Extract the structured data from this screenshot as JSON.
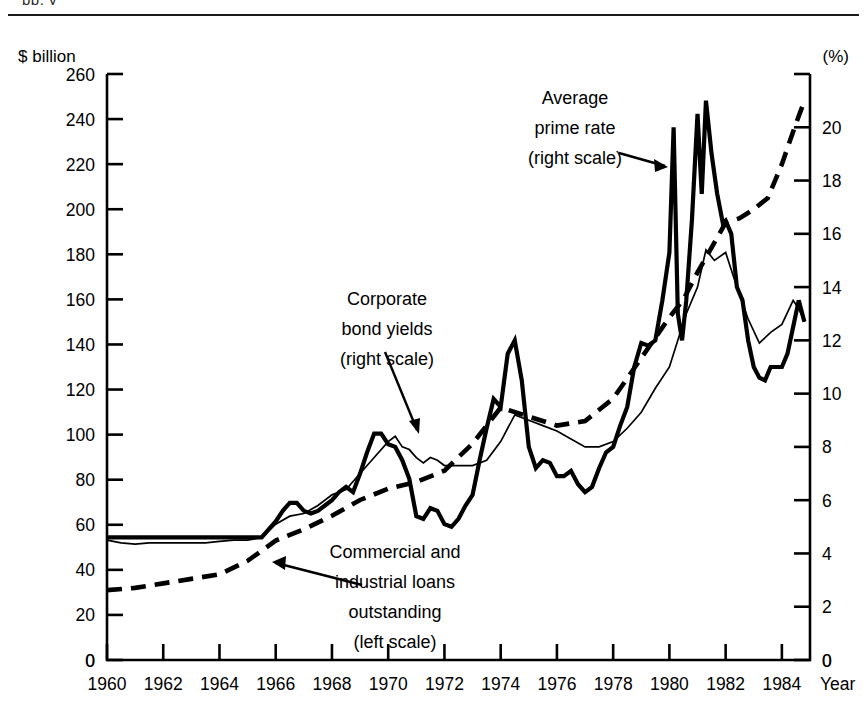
{
  "page": {
    "top_cut_text": "pp. y",
    "background": "#ffffff",
    "ink": "#000000"
  },
  "chart_data": {
    "type": "line",
    "title": "",
    "xlabel": "Year",
    "grid": false,
    "legend_position": "inline-annotations",
    "left_axis": {
      "label": "$ billion",
      "ticks": [
        0,
        20,
        40,
        60,
        80,
        100,
        120,
        140,
        160,
        180,
        200,
        220,
        240,
        260
      ],
      "lim": [
        0,
        260
      ]
    },
    "right_axis": {
      "label": "(%)",
      "ticks": [
        0,
        2,
        4,
        6,
        8,
        10,
        12,
        14,
        16,
        18,
        20
      ],
      "lim": [
        0,
        22
      ]
    },
    "x_axis": {
      "tick_labels": [
        "1960",
        "1962",
        "1964",
        "1966",
        "1968",
        "1970",
        "1972",
        "1974",
        "1976",
        "1978",
        "1980",
        "1982",
        "1984"
      ],
      "tick_values": [
        1960,
        1962,
        1964,
        1966,
        1968,
        1970,
        1972,
        1974,
        1976,
        1978,
        1980,
        1982,
        1984
      ],
      "corner_label_left": "0",
      "corner_label_right": "0",
      "lim": [
        1960,
        1985
      ]
    },
    "series": [
      {
        "name": "Average prime rate",
        "scale": "right",
        "style": "thick-solid",
        "x": [
          1960.0,
          1960.5,
          1961.0,
          1961.5,
          1962.0,
          1962.5,
          1963.0,
          1963.5,
          1964.0,
          1964.5,
          1965.0,
          1965.5,
          1966.0,
          1966.25,
          1966.5,
          1966.75,
          1967.0,
          1967.25,
          1967.5,
          1967.75,
          1968.0,
          1968.25,
          1968.5,
          1968.75,
          1969.0,
          1969.25,
          1969.5,
          1969.75,
          1970.0,
          1970.25,
          1970.5,
          1970.75,
          1971.0,
          1971.25,
          1971.5,
          1971.75,
          1972.0,
          1972.25,
          1972.5,
          1972.75,
          1973.0,
          1973.25,
          1973.5,
          1973.75,
          1974.0,
          1974.25,
          1974.5,
          1974.75,
          1975.0,
          1975.25,
          1975.5,
          1975.75,
          1976.0,
          1976.25,
          1976.5,
          1976.75,
          1977.0,
          1977.25,
          1977.5,
          1977.75,
          1978.0,
          1978.25,
          1978.5,
          1978.75,
          1979.0,
          1979.25,
          1979.5,
          1979.75,
          1980.0,
          1980.15,
          1980.3,
          1980.45,
          1980.6,
          1980.8,
          1981.0,
          1981.15,
          1981.3,
          1981.5,
          1981.7,
          1981.9,
          1982.0,
          1982.2,
          1982.4,
          1982.6,
          1982.8,
          1983.0,
          1983.2,
          1983.4,
          1983.6,
          1983.8,
          1984.0,
          1984.2,
          1984.4,
          1984.6,
          1984.8
        ],
        "y": [
          4.6,
          4.6,
          4.6,
          4.6,
          4.6,
          4.6,
          4.6,
          4.6,
          4.6,
          4.6,
          4.6,
          4.6,
          5.2,
          5.6,
          5.9,
          5.9,
          5.6,
          5.5,
          5.6,
          5.8,
          6.0,
          6.3,
          6.5,
          6.3,
          7.0,
          7.8,
          8.5,
          8.5,
          8.1,
          8.0,
          7.5,
          6.8,
          5.4,
          5.3,
          5.7,
          5.6,
          5.1,
          5.0,
          5.3,
          5.8,
          6.2,
          7.5,
          8.7,
          9.8,
          9.5,
          11.5,
          12.0,
          10.5,
          8.0,
          7.2,
          7.5,
          7.4,
          6.9,
          6.9,
          7.1,
          6.6,
          6.3,
          6.5,
          7.2,
          7.8,
          8.0,
          8.8,
          9.5,
          11.0,
          11.9,
          11.8,
          12.0,
          13.5,
          15.3,
          20.0,
          13.0,
          12.0,
          13.5,
          16.5,
          20.5,
          17.5,
          21.0,
          19.0,
          17.5,
          16.4,
          16.5,
          16.0,
          14.0,
          13.5,
          12.0,
          11.0,
          10.6,
          10.5,
          11.0,
          11.0,
          11.0,
          11.5,
          12.5,
          13.5,
          12.7
        ],
        "peaks": [
          {
            "year": 1974.5,
            "value": 12.0
          },
          {
            "year": 1980.15,
            "value": 20.0
          },
          {
            "year": 1980.8,
            "value": 20.5
          },
          {
            "year": 1981.3,
            "value": 21.0
          }
        ],
        "troughs": [
          {
            "year": 1971.0,
            "value": 5.4
          },
          {
            "year": 1977.0,
            "value": 6.3
          },
          {
            "year": 1983.4,
            "value": 10.5
          }
        ]
      },
      {
        "name": "Corporate bond yields",
        "scale": "right",
        "style": "thin-solid",
        "x": [
          1960.0,
          1960.5,
          1961.0,
          1961.5,
          1962.0,
          1962.5,
          1963.0,
          1963.5,
          1964.0,
          1964.5,
          1965.0,
          1965.5,
          1966.0,
          1966.5,
          1967.0,
          1967.5,
          1968.0,
          1968.5,
          1969.0,
          1969.5,
          1970.0,
          1970.25,
          1970.5,
          1970.75,
          1971.0,
          1971.25,
          1971.5,
          1971.75,
          1972.0,
          1972.5,
          1973.0,
          1973.5,
          1974.0,
          1974.5,
          1975.0,
          1975.5,
          1976.0,
          1976.5,
          1977.0,
          1977.5,
          1978.0,
          1978.5,
          1979.0,
          1979.5,
          1980.0,
          1980.3,
          1980.6,
          1981.0,
          1981.3,
          1981.6,
          1982.0,
          1982.4,
          1982.8,
          1983.2,
          1983.6,
          1984.0,
          1984.4,
          1984.6,
          1984.8
        ],
        "y": [
          4.5,
          4.4,
          4.35,
          4.4,
          4.4,
          4.4,
          4.4,
          4.4,
          4.45,
          4.5,
          4.5,
          4.6,
          5.1,
          5.4,
          5.5,
          5.8,
          6.2,
          6.4,
          7.0,
          7.6,
          8.2,
          8.4,
          8.0,
          7.9,
          7.6,
          7.4,
          7.6,
          7.5,
          7.3,
          7.3,
          7.3,
          7.5,
          8.2,
          9.2,
          9.0,
          8.8,
          8.6,
          8.3,
          8.0,
          8.0,
          8.2,
          8.7,
          9.3,
          10.2,
          11.0,
          12.0,
          13.0,
          14.0,
          15.4,
          15.0,
          15.3,
          14.0,
          12.8,
          11.9,
          12.3,
          12.6,
          13.5,
          13.2,
          12.7
        ]
      },
      {
        "name": "Commercial and industrial loans outstanding",
        "scale": "left",
        "style": "thick-dashed",
        "unit": "$ billion",
        "x": [
          1960,
          1961,
          1962,
          1963,
          1964,
          1965,
          1966,
          1967,
          1968,
          1969,
          1970,
          1971,
          1972,
          1973,
          1974,
          1975,
          1976,
          1977,
          1978,
          1979,
          1980,
          1980.5,
          1981,
          1981.5,
          1982,
          1982.5,
          1983,
          1983.5,
          1984,
          1984.5,
          1984.8
        ],
        "y": [
          31,
          32,
          34,
          36,
          38,
          44,
          53,
          58,
          64,
          71,
          76,
          79,
          84,
          96,
          112,
          108,
          104,
          106,
          116,
          134,
          152,
          160,
          172,
          183,
          194,
          196,
          200,
          205,
          220,
          238,
          248
        ]
      }
    ],
    "annotations": [
      {
        "id": "prime-rate",
        "lines": [
          "Average",
          "prime rate",
          "(right scale)"
        ],
        "target_series": "Average prime rate",
        "arrow": "points-right"
      },
      {
        "id": "bond-yields",
        "lines": [
          "Corporate",
          "bond yields",
          "(right scale)"
        ],
        "target_series": "Corporate bond yields",
        "arrow": "points-down-right"
      },
      {
        "id": "ci-loans",
        "lines": [
          "Commercial and",
          "industrial loans",
          "outstanding",
          "(left scale)"
        ],
        "target_series": "Commercial and industrial loans outstanding",
        "arrow": "points-left"
      }
    ]
  }
}
